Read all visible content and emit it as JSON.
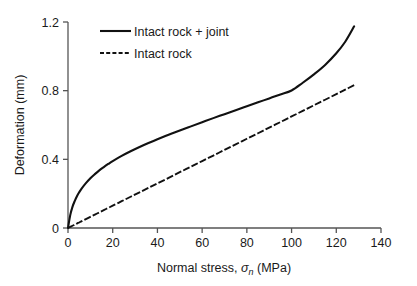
{
  "chart_data": {
    "type": "line",
    "title": "",
    "xlabel": "Normal stress, σn (MPa)",
    "xlabel_parts": {
      "prefix": "Normal stress, ",
      "symbol": "σ",
      "subscript": "n",
      "suffix": " (MPa)"
    },
    "ylabel": "Deformation (mm)",
    "xlim": [
      0,
      140
    ],
    "ylim": [
      0,
      1.2
    ],
    "xticks": [
      0,
      20,
      40,
      60,
      80,
      100,
      120,
      140
    ],
    "xtick_labels": [
      "0",
      "20",
      "40",
      "60",
      "80",
      "100",
      "120",
      "140"
    ],
    "yticks": [
      0,
      0.4,
      0.8,
      1.2
    ],
    "ytick_labels": [
      "0",
      "0.4",
      "0.8",
      "1.2"
    ],
    "grid": false,
    "legend_position": "top-left-inside",
    "x": [
      0,
      1,
      2,
      3,
      4,
      5,
      6,
      8,
      10,
      12,
      14,
      16,
      18,
      20,
      24,
      28,
      32,
      36,
      40,
      45,
      50,
      55,
      60,
      65,
      70,
      75,
      80,
      85,
      90,
      95,
      100,
      105,
      110,
      115,
      120,
      124,
      128
    ],
    "series": [
      {
        "name": "Intact rock + joint",
        "style": "solid",
        "color": "#111111",
        "values": [
          0.0,
          0.075,
          0.123,
          0.157,
          0.185,
          0.208,
          0.228,
          0.261,
          0.29,
          0.314,
          0.336,
          0.355,
          0.373,
          0.39,
          0.42,
          0.447,
          0.472,
          0.495,
          0.517,
          0.543,
          0.568,
          0.592,
          0.616,
          0.64,
          0.663,
          0.686,
          0.709,
          0.732,
          0.755,
          0.778,
          0.801,
          0.846,
          0.895,
          0.95,
          1.018,
          1.085,
          1.175
        ]
      },
      {
        "name": "Intact rock",
        "style": "dashed",
        "color": "#111111",
        "values": [
          0.0,
          0.006,
          0.013,
          0.019,
          0.026,
          0.032,
          0.039,
          0.052,
          0.065,
          0.078,
          0.091,
          0.104,
          0.117,
          0.13,
          0.156,
          0.182,
          0.208,
          0.234,
          0.26,
          0.292,
          0.325,
          0.357,
          0.39,
          0.422,
          0.455,
          0.487,
          0.52,
          0.552,
          0.585,
          0.617,
          0.65,
          0.682,
          0.715,
          0.747,
          0.78,
          0.806,
          0.832
        ]
      }
    ],
    "legend": [
      {
        "label": "Intact rock + joint",
        "style": "solid"
      },
      {
        "label": "Intact rock",
        "style": "dashed"
      }
    ]
  },
  "colors": {
    "background": "#ffffff",
    "axis": "#555555",
    "ink": "#111111",
    "text": "#1a1a1a"
  }
}
